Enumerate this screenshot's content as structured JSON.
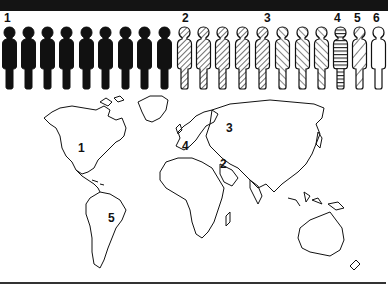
{
  "header_bar": {
    "color": "#141414"
  },
  "group_labels": [
    {
      "id": "1",
      "text": "1",
      "x": 4
    },
    {
      "id": "2",
      "text": "2",
      "x": 182
    },
    {
      "id": "3",
      "text": "3",
      "x": 264
    },
    {
      "id": "4",
      "text": "4",
      "x": 334
    },
    {
      "id": "5",
      "text": "5",
      "x": 354
    },
    {
      "id": "6",
      "text": "6",
      "x": 373
    }
  ],
  "figures": {
    "total": 20,
    "groups": [
      {
        "group": "1",
        "count": 9,
        "pattern": "solid-black"
      },
      {
        "group": "2",
        "count": 1,
        "pattern": "half-black-half-hatched"
      },
      {
        "group": "3",
        "count": 7,
        "pattern": "diagonal-hatch"
      },
      {
        "group": "4",
        "count": 1,
        "pattern": "horizontal-stripes"
      },
      {
        "group": "5",
        "count": 1,
        "pattern": "mixed-diagonal-stripes"
      },
      {
        "group": "6",
        "count": 1,
        "pattern": "empty-outline"
      }
    ]
  },
  "map": {
    "region_labels": [
      {
        "text": "1",
        "region": "North America",
        "x": 78,
        "y": 64
      },
      {
        "text": "2",
        "region": "Middle East",
        "x": 220,
        "y": 78
      },
      {
        "text": "3",
        "region": "Eastern Europe / Russia",
        "x": 226,
        "y": 42
      },
      {
        "text": "4",
        "region": "Western Europe",
        "x": 182,
        "y": 60
      },
      {
        "text": "5",
        "region": "South America",
        "x": 108,
        "y": 132
      }
    ]
  }
}
